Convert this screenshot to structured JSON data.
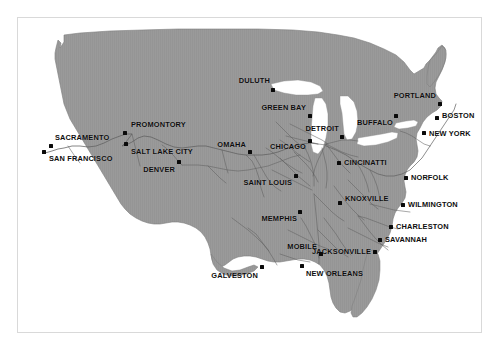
{
  "figure": {
    "frame_color": "#d9d9d9",
    "land_color": "#9a9a9a",
    "water_color": "#ffffff",
    "rail_color": "#5f5f5f",
    "dot_color": "#0a0a0a",
    "label_color": "#0d0d0d",
    "background_color": "#ffffff"
  },
  "cities": [
    {
      "name": "DULUTH",
      "dot_x": 273,
      "dot_y": 90,
      "label_x": 270,
      "label_y": 81,
      "align": "right"
    },
    {
      "name": "GREEN BAY",
      "dot_x": 310,
      "dot_y": 116,
      "label_x": 306,
      "label_y": 108,
      "align": "right"
    },
    {
      "name": "PORTLAND",
      "dot_x": 440,
      "dot_y": 104,
      "label_x": 436,
      "label_y": 96,
      "align": "right"
    },
    {
      "name": "BOSTON",
      "dot_x": 437,
      "dot_y": 118,
      "label_x": 442,
      "label_y": 116,
      "align": "left"
    },
    {
      "name": "BUFFALO",
      "dot_x": 396,
      "dot_y": 116,
      "label_x": 393,
      "label_y": 123,
      "align": "right"
    },
    {
      "name": "NEW YORK",
      "dot_x": 424,
      "dot_y": 133,
      "label_x": 429,
      "label_y": 134,
      "align": "left"
    },
    {
      "name": "DETROIT",
      "dot_x": 342,
      "dot_y": 137,
      "label_x": 339,
      "label_y": 129,
      "align": "right"
    },
    {
      "name": "CHICAGO",
      "dot_x": 310,
      "dot_y": 141,
      "label_x": 306,
      "label_y": 147,
      "align": "right"
    },
    {
      "name": "CINCINATTI",
      "dot_x": 339,
      "dot_y": 163,
      "label_x": 344,
      "label_y": 163,
      "align": "left"
    },
    {
      "name": "NORFOLK",
      "dot_x": 406,
      "dot_y": 178,
      "label_x": 411,
      "label_y": 178,
      "align": "left"
    },
    {
      "name": "SAINT LOUIS",
      "dot_x": 296,
      "dot_y": 176,
      "label_x": 292,
      "label_y": 183,
      "align": "right"
    },
    {
      "name": "KNOXVILLE",
      "dot_x": 340,
      "dot_y": 203,
      "label_x": 345,
      "label_y": 199,
      "align": "left"
    },
    {
      "name": "WILMINGTON",
      "dot_x": 403,
      "dot_y": 205,
      "label_x": 408,
      "label_y": 205,
      "align": "left"
    },
    {
      "name": "MEMPHIS",
      "dot_x": 300,
      "dot_y": 212,
      "label_x": 297,
      "label_y": 219,
      "align": "right"
    },
    {
      "name": "CHARLESTON",
      "dot_x": 391,
      "dot_y": 227,
      "label_x": 396,
      "label_y": 227,
      "align": "left"
    },
    {
      "name": "SAVANNAH",
      "dot_x": 380,
      "dot_y": 240,
      "label_x": 385,
      "label_y": 240,
      "align": "left"
    },
    {
      "name": "JACKSONVILLE",
      "dot_x": 375,
      "dot_y": 252,
      "label_x": 371,
      "label_y": 252,
      "align": "right"
    },
    {
      "name": "MOBILE",
      "dot_x": 321,
      "dot_y": 254,
      "label_x": 317,
      "label_y": 247,
      "align": "right"
    },
    {
      "name": "NEW ORLEANS",
      "dot_x": 302,
      "dot_y": 266,
      "label_x": 306,
      "label_y": 274,
      "align": "left"
    },
    {
      "name": "GALVESTON",
      "dot_x": 262,
      "dot_y": 267,
      "label_x": 258,
      "label_y": 276,
      "align": "right"
    },
    {
      "name": "OMAHA",
      "dot_x": 250,
      "dot_y": 152,
      "label_x": 246,
      "label_y": 145,
      "align": "right"
    },
    {
      "name": "DENVER",
      "dot_x": 179,
      "dot_y": 162,
      "label_x": 175,
      "label_y": 170,
      "align": "right"
    },
    {
      "name": "PROMONTORY",
      "dot_x": 125,
      "dot_y": 133,
      "label_x": 131,
      "label_y": 125,
      "align": "left"
    },
    {
      "name": "SALT LAKE CITY",
      "dot_x": 126,
      "dot_y": 144,
      "label_x": 131,
      "label_y": 152,
      "align": "left"
    },
    {
      "name": "SACRAMENTO",
      "dot_x": 51,
      "dot_y": 146,
      "label_x": 55,
      "label_y": 138,
      "align": "left"
    },
    {
      "name": "SAN FRANCISCO",
      "dot_x": 44,
      "dot_y": 152,
      "label_x": 49,
      "label_y": 159,
      "align": "left"
    }
  ]
}
